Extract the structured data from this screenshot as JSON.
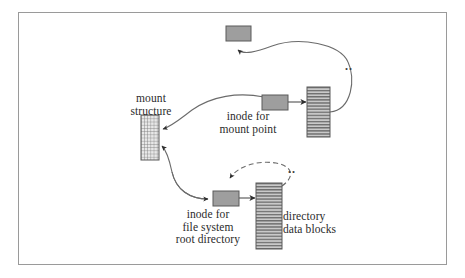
{
  "figure": {
    "frame": {
      "border_color": "#9a9a9a",
      "background": "#ffffff"
    }
  },
  "colors": {
    "box_fill": "#9e9e9e",
    "box_stroke": "#5a5a5a",
    "striped_fill": "#c9c9c9",
    "stripe_color": "#6f6f6f",
    "mesh_fill": "#e3e3e3",
    "mesh_color": "#7a7a7a",
    "line": "#6b6b6b",
    "arrow": "#2e2e2e",
    "text": "#2b2b2b"
  },
  "labels": {
    "mount_structure": "mount\nstructure",
    "inode_mount_point": "inode for\nmount point",
    "inode_root_directory": "inode for\nfile system\nroot directory",
    "directory_data_blocks": "directory\ndata blocks",
    "dotdot_top": "..",
    "dotdot_bottom": ".."
  },
  "nodes": [
    {
      "id": "parent-inode-box",
      "name": "parent directory inode box",
      "shape": "solid-box",
      "x": 226,
      "y": 26,
      "w": 25,
      "h": 15
    },
    {
      "id": "mount-structure-box",
      "name": "mount structure",
      "shape": "mesh-box",
      "x": 141,
      "y": 115,
      "w": 18,
      "h": 45
    },
    {
      "id": "inode-mount-point-box",
      "name": "inode for mount point",
      "shape": "solid-box",
      "x": 262,
      "y": 95,
      "w": 26,
      "h": 15
    },
    {
      "id": "mount-point-dir-box",
      "name": "mount point directory data block",
      "shape": "striped-box",
      "x": 307,
      "y": 87,
      "w": 23,
      "h": 50
    },
    {
      "id": "inode-root-box",
      "name": "inode for file system root directory",
      "shape": "solid-box",
      "x": 213,
      "y": 191,
      "w": 26,
      "h": 15
    },
    {
      "id": "root-dir-blocks-box",
      "name": "directory data blocks",
      "shape": "striped-box",
      "x": 256,
      "y": 183,
      "w": 26,
      "h": 66
    }
  ],
  "edges": [
    {
      "id": "e-dirblock-to-parent",
      "from": "mount-point-dir-box",
      "to": "parent-inode-box",
      "style": "solid",
      "note": "dot-dot link up to parent inode"
    },
    {
      "id": "e-inode-to-mount",
      "from": "inode-mount-point-box",
      "to": "mount-structure-box",
      "style": "solid",
      "note": "inode for mount point points to mount structure"
    },
    {
      "id": "e-inode-to-dirblock",
      "from": "inode-mount-point-box",
      "to": "mount-point-dir-box",
      "style": "solid",
      "note": "straight arrow right"
    },
    {
      "id": "e-mount-to-rootinode",
      "from": "mount-structure-box",
      "to": "inode-root-box",
      "style": "solid",
      "note": "mount structure to root inode (bidirectional curve)"
    },
    {
      "id": "e-rootblock-to-rootinode",
      "from": "root-dir-blocks-box",
      "to": "inode-root-box",
      "style": "dashed",
      "note": "dot-dot back to root inode"
    },
    {
      "id": "e-rootinode-to-blocks",
      "from": "inode-root-box",
      "to": "root-dir-blocks-box",
      "style": "solid",
      "note": "straight arrow right"
    }
  ]
}
